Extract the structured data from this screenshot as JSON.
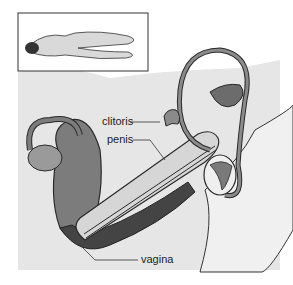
{
  "diagram": {
    "type": "anatomical-cross-section",
    "inset": {
      "description": "figure lying face down"
    },
    "labels": [
      {
        "id": "clitoris",
        "text": "clitoris"
      },
      {
        "id": "penis",
        "text": "penis"
      },
      {
        "id": "vagina",
        "text": "vagina"
      }
    ],
    "colors": {
      "background": "#e8e8e8",
      "organ_dark": "#5a5a5a",
      "organ_mid": "#8a8a8a",
      "organ_light": "#c8c8c8",
      "outline": "#2a2a2a"
    }
  }
}
